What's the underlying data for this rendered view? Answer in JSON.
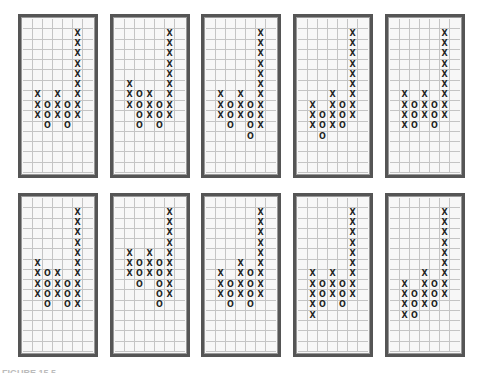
{
  "chart_data": {
    "type": "point-and-figure",
    "title": "",
    "grid": {
      "columns": 7,
      "rows": 15
    },
    "panels": [
      {
        "id": 1,
        "columns": [
          {
            "col": 1,
            "sym": "X",
            "from": 7,
            "to": 9
          },
          {
            "col": 2,
            "sym": "O",
            "from": 8,
            "to": 10
          },
          {
            "col": 3,
            "sym": "X",
            "from": 7,
            "to": 9
          },
          {
            "col": 4,
            "sym": "O",
            "from": 8,
            "to": 10
          },
          {
            "col": 5,
            "sym": "X",
            "from": 1,
            "to": 9
          }
        ]
      },
      {
        "id": 2,
        "columns": [
          {
            "col": 1,
            "sym": "X",
            "from": 6,
            "to": 8
          },
          {
            "col": 2,
            "sym": "O",
            "from": 7,
            "to": 10
          },
          {
            "col": 3,
            "sym": "X",
            "from": 7,
            "to": 9
          },
          {
            "col": 4,
            "sym": "O",
            "from": 8,
            "to": 10
          },
          {
            "col": 5,
            "sym": "X",
            "from": 1,
            "to": 9
          }
        ]
      },
      {
        "id": 3,
        "columns": [
          {
            "col": 1,
            "sym": "X",
            "from": 7,
            "to": 9
          },
          {
            "col": 2,
            "sym": "O",
            "from": 8,
            "to": 10
          },
          {
            "col": 3,
            "sym": "X",
            "from": 7,
            "to": 9
          },
          {
            "col": 4,
            "sym": "O",
            "from": 8,
            "to": 11
          },
          {
            "col": 5,
            "sym": "X",
            "from": 1,
            "to": 10
          }
        ]
      },
      {
        "id": 4,
        "columns": [
          {
            "col": 1,
            "sym": "X",
            "from": 8,
            "to": 10
          },
          {
            "col": 2,
            "sym": "O",
            "from": 9,
            "to": 11
          },
          {
            "col": 3,
            "sym": "X",
            "from": 7,
            "to": 10
          },
          {
            "col": 4,
            "sym": "O",
            "from": 8,
            "to": 10
          },
          {
            "col": 5,
            "sym": "X",
            "from": 1,
            "to": 9
          }
        ]
      },
      {
        "id": 5,
        "columns": [
          {
            "col": 1,
            "sym": "X",
            "from": 7,
            "to": 10
          },
          {
            "col": 2,
            "sym": "O",
            "from": 8,
            "to": 10
          },
          {
            "col": 3,
            "sym": "X",
            "from": 7,
            "to": 9
          },
          {
            "col": 4,
            "sym": "O",
            "from": 8,
            "to": 10
          },
          {
            "col": 5,
            "sym": "X",
            "from": 1,
            "to": 9
          }
        ]
      },
      {
        "id": 6,
        "columns": [
          {
            "col": 1,
            "sym": "X",
            "from": 6,
            "to": 9
          },
          {
            "col": 2,
            "sym": "O",
            "from": 7,
            "to": 10
          },
          {
            "col": 3,
            "sym": "X",
            "from": 7,
            "to": 9
          },
          {
            "col": 4,
            "sym": "O",
            "from": 8,
            "to": 10
          },
          {
            "col": 5,
            "sym": "X",
            "from": 1,
            "to": 10
          }
        ]
      },
      {
        "id": 7,
        "columns": [
          {
            "col": 1,
            "sym": "X",
            "from": 5,
            "to": 7
          },
          {
            "col": 2,
            "sym": "O",
            "from": 6,
            "to": 8
          },
          {
            "col": 3,
            "sym": "X",
            "from": 5,
            "to": 7
          },
          {
            "col": 4,
            "sym": "O",
            "from": 6,
            "to": 10
          },
          {
            "col": 5,
            "sym": "X",
            "from": 1,
            "to": 9
          }
        ]
      },
      {
        "id": 8,
        "columns": [
          {
            "col": 1,
            "sym": "X",
            "from": 7,
            "to": 9
          },
          {
            "col": 2,
            "sym": "O",
            "from": 8,
            "to": 10
          },
          {
            "col": 3,
            "sym": "X",
            "from": 6,
            "to": 9
          },
          {
            "col": 4,
            "sym": "O",
            "from": 7,
            "to": 10
          },
          {
            "col": 5,
            "sym": "X",
            "from": 1,
            "to": 9
          }
        ]
      },
      {
        "id": 9,
        "columns": [
          {
            "col": 1,
            "sym": "X",
            "from": 7,
            "to": 11
          },
          {
            "col": 2,
            "sym": "O",
            "from": 8,
            "to": 10
          },
          {
            "col": 3,
            "sym": "X",
            "from": 7,
            "to": 9
          },
          {
            "col": 4,
            "sym": "O",
            "from": 8,
            "to": 10
          },
          {
            "col": 5,
            "sym": "X",
            "from": 1,
            "to": 9
          }
        ]
      },
      {
        "id": 10,
        "columns": [
          {
            "col": 1,
            "sym": "X",
            "from": 8,
            "to": 11
          },
          {
            "col": 2,
            "sym": "O",
            "from": 9,
            "to": 11
          },
          {
            "col": 3,
            "sym": "X",
            "from": 7,
            "to": 10
          },
          {
            "col": 4,
            "sym": "O",
            "from": 8,
            "to": 10
          },
          {
            "col": 5,
            "sym": "X",
            "from": 1,
            "to": 9
          }
        ]
      }
    ]
  },
  "layout": {
    "positions": [
      [
        18,
        14
      ],
      [
        110,
        14
      ],
      [
        201,
        14
      ],
      [
        293,
        14
      ],
      [
        385,
        14
      ],
      [
        18,
        193
      ],
      [
        110,
        193
      ],
      [
        201,
        193
      ],
      [
        293,
        193
      ],
      [
        385,
        193
      ]
    ]
  },
  "caption": "FIGURE 15.5"
}
